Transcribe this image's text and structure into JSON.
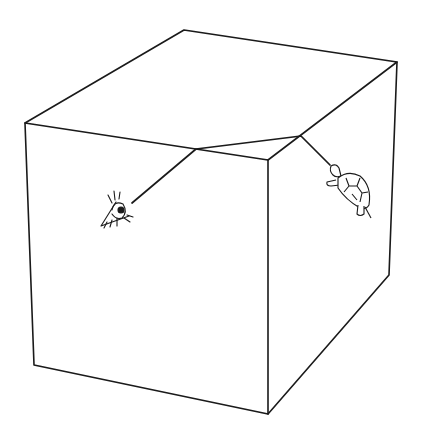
{
  "diagram": {
    "type": "line-drawing",
    "colors": {
      "stroke": "#1a1a1a",
      "background": "#ffffff"
    },
    "box": {
      "vertices": {
        "front_top_left": [
          25,
          123
        ],
        "top_back_left": [
          184,
          30
        ],
        "top_back_right": [
          397,
          62
        ],
        "front_top_right": [
          268,
          160
        ],
        "front_bottom_left": [
          34,
          365
        ],
        "front_bottom_right": [
          268,
          414
        ],
        "side_bottom_right": [
          389,
          275
        ]
      }
    },
    "path": {
      "points": [
        [
          132,
          203
        ],
        [
          196,
          149
        ],
        [
          301,
          136
        ],
        [
          330,
          165
        ]
      ]
    },
    "figures": [
      {
        "name": "eye",
        "position": [
          118,
          210
        ]
      },
      {
        "name": "turtle",
        "position": [
          352,
          185
        ]
      }
    ]
  }
}
